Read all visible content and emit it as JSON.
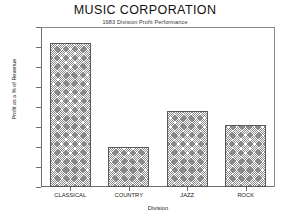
{
  "chart_data": {
    "type": "bar",
    "title": "MUSIC CORPORATION",
    "subtitle": "1983 Division Profit Performance",
    "categories": [
      "CLASSICAL",
      "COUNTRY",
      "JAZZ",
      "ROCK"
    ],
    "values": [
      72,
      20,
      38,
      31
    ],
    "xlabel": "Division",
    "ylabel": "Profit as a % of Revenue",
    "ylim": [
      0,
      80
    ],
    "ytick_labels": [
      "80%",
      "70%",
      "60%",
      "50%",
      "40%",
      "30%",
      "20%",
      "10%",
      "0%"
    ],
    "ytick_values": [
      80,
      70,
      60,
      50,
      40,
      30,
      20,
      10,
      0
    ],
    "grid": false,
    "legend": "none",
    "bar_fill": "#8a8a8a",
    "bar_border": "#5a5a5a",
    "frame_color": "#8d8d8d",
    "background": "#ffffff"
  }
}
